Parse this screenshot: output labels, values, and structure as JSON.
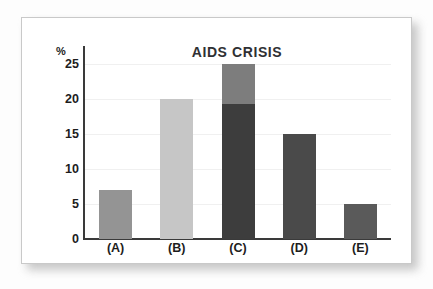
{
  "chart_data": {
    "type": "bar",
    "title": "AIDS CRISIS",
    "xlabel": "",
    "ylabel": "%",
    "categories": [
      "(A)",
      "(B)",
      "(C)",
      "(D)",
      "(E)"
    ],
    "values": [
      7,
      20,
      25,
      15,
      5
    ],
    "stacked": true,
    "series": [
      {
        "name": "lower-segment",
        "values": [
          7,
          20,
          19.3,
          15,
          5
        ],
        "colors": [
          "#949494",
          "#c6c6c6",
          "#3d3d3d",
          "#4a4a4a",
          "#5a5a5a"
        ]
      },
      {
        "name": "upper-segment",
        "values": [
          0,
          0,
          5.7,
          0,
          0
        ],
        "colors": [
          "",
          "",
          "#7d7d7d",
          "",
          ""
        ]
      }
    ],
    "bars": [
      {
        "category": "(A)",
        "total": 7,
        "segments": [
          {
            "value": 7,
            "color": "#949494"
          }
        ]
      },
      {
        "category": "(B)",
        "total": 20,
        "segments": [
          {
            "value": 20,
            "color": "#c6c6c6"
          }
        ]
      },
      {
        "category": "(C)",
        "total": 25,
        "segments": [
          {
            "value": 19.3,
            "color": "#3d3d3d"
          },
          {
            "value": 5.7,
            "color": "#7d7d7d"
          }
        ]
      },
      {
        "category": "(D)",
        "total": 15,
        "segments": [
          {
            "value": 15,
            "color": "#4a4a4a"
          }
        ]
      },
      {
        "category": "(E)",
        "total": 5,
        "segments": [
          {
            "value": 5,
            "color": "#5a5a5a"
          }
        ]
      }
    ],
    "yticks": [
      0,
      5,
      10,
      15,
      20,
      25
    ],
    "ytick_labels": [
      "0",
      "5",
      "10",
      "15",
      "20",
      "25"
    ],
    "ylim": [
      0,
      27.5
    ],
    "grid": true,
    "grid_color": "#f0f0f0",
    "legend": "none",
    "axis_color": "#3a3a3a",
    "title_color": "#2f3033",
    "text_color": "#1d1d1d",
    "background": "#ffffff"
  }
}
